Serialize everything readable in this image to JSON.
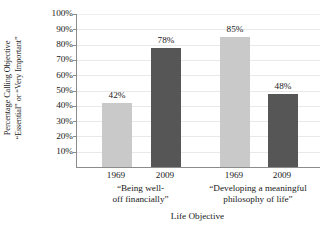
{
  "chart_data": {
    "type": "bar",
    "title": "",
    "xlabel": "Life Objective",
    "ylabel_line1": "Percentage Calling Objective",
    "ylabel_line2": "“Essential” or “Very Important”",
    "ylim": [
      0,
      100
    ],
    "ytick_labels": [
      "100%",
      "90%",
      "80%",
      "70%",
      "60%",
      "50%",
      "40%",
      "30%",
      "20%",
      "10%"
    ],
    "ytick_values": [
      100,
      90,
      80,
      70,
      60,
      50,
      40,
      30,
      20,
      10
    ],
    "grid": true,
    "legend": "none",
    "categories": [
      "1969",
      "2009",
      "1969",
      "2009"
    ],
    "groups": [
      {
        "label_line1": "“Being well-",
        "label_line2": "off financially”",
        "bars": [
          {
            "category": "1969",
            "value": 42,
            "data_label": "42%",
            "color": "#c9c9c9",
            "series": "1969"
          },
          {
            "category": "2009",
            "value": 78,
            "data_label": "78%",
            "color": "#565656",
            "series": "2009"
          }
        ]
      },
      {
        "label_line1": "“Developing a meaningful",
        "label_line2": "philosophy of life”",
        "bars": [
          {
            "category": "1969",
            "value": 85,
            "data_label": "85%",
            "color": "#c9c9c9",
            "series": "1969"
          },
          {
            "category": "2009",
            "value": 48,
            "data_label": "48%",
            "color": "#565656",
            "series": "2009"
          }
        ]
      }
    ],
    "values": [
      42,
      78,
      85,
      48
    ],
    "data_labels": [
      "42%",
      "78%",
      "85%",
      "48%"
    ],
    "colors": {
      "light_bar": "#c9c9c9",
      "dark_bar": "#565656",
      "axis": "#8c8c8c",
      "grid": "#e9e9e9",
      "text": "#1a1a1a",
      "background": "#ffffff"
    }
  }
}
